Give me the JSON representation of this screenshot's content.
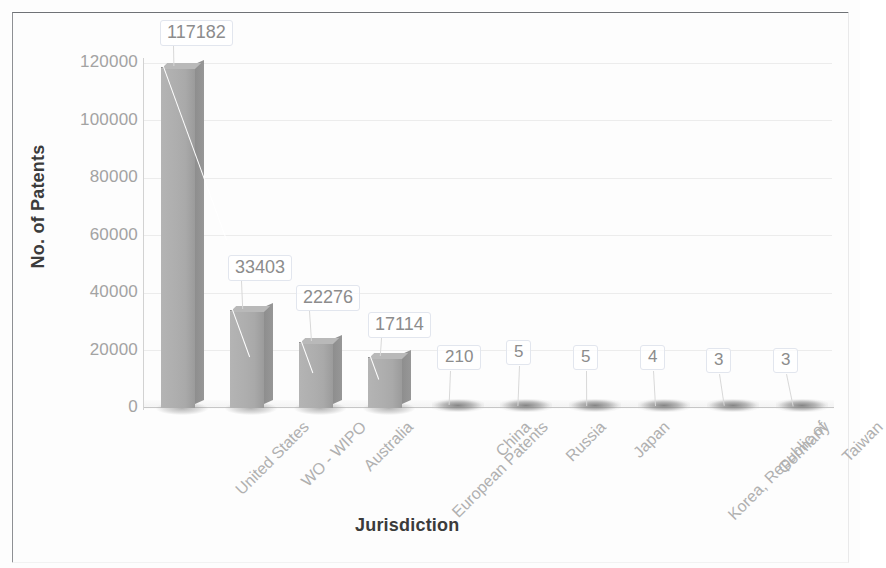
{
  "chart_data": {
    "type": "bar",
    "title": "",
    "xlabel": "Jurisdiction",
    "ylabel": "No. of Patents",
    "categories": [
      "United States",
      "WO - WIPO",
      "Australia",
      "European Patents",
      "China",
      "Russia",
      "Japan",
      "Korea, Republic of",
      "Germany",
      "Taiwan"
    ],
    "values": [
      117182,
      33403,
      22276,
      17114,
      210,
      5,
      5,
      4,
      3,
      3
    ],
    "data_labels": [
      "117182",
      "33403",
      "22276",
      "17114",
      "210",
      "5",
      "5",
      "4",
      "3",
      "3"
    ],
    "ylim": [
      0,
      120000
    ],
    "ytick_values": [
      0,
      20000,
      40000,
      60000,
      80000,
      100000,
      120000
    ],
    "ytick_labels": [
      "0",
      "20000",
      "40000",
      "60000",
      "80000",
      "100000",
      "120000"
    ],
    "grid": true,
    "legend": false,
    "legend_position": "none",
    "bar_style": "3d-column",
    "series": [
      {
        "name": "No. of Patents",
        "values": [
          117182,
          33403,
          22276,
          17114,
          210,
          5,
          5,
          4,
          3,
          3
        ]
      }
    ]
  },
  "axes": {
    "y_title": "No. of Patents",
    "x_title": "Jurisdiction"
  },
  "colors": {
    "bar_face": "#aeaeae",
    "bar_side": "#8e8e8e",
    "bar_top": "#b9b9b9",
    "gridline": "#ececec",
    "tick_text": "#a3a3a3",
    "category_text": "#b0b0b0",
    "axis_title_text": "#3b3b3b",
    "label_text": "#8c8c8c",
    "callout_border": "#e2e6ee",
    "frame": "#8e9094",
    "background": "#ffffff"
  }
}
